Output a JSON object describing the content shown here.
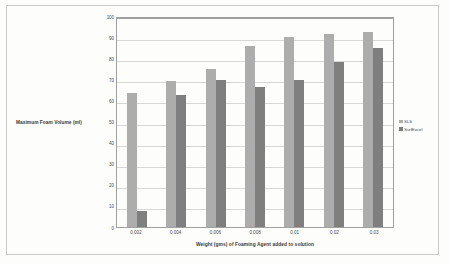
{
  "chart_data": {
    "type": "bar",
    "title": "",
    "xlabel": "Weight (gms) of Foaming Agent added to solution",
    "ylabel": "Maximum Foam Volume (ml)",
    "categories": [
      "0.002",
      "0.004",
      "0.006",
      "0.008",
      "0.01",
      "0.02",
      "0.03"
    ],
    "series": [
      {
        "name": "SLS",
        "color": "#adadad",
        "values": [
          63.5,
          69,
          75,
          86,
          90,
          91.5,
          92.5
        ]
      },
      {
        "name": "SurfExcel",
        "color": "#7f7f7f",
        "values": [
          7.5,
          62.5,
          69.5,
          66.5,
          69.5,
          78,
          85
        ]
      }
    ],
    "ylim": [
      0,
      100
    ],
    "ytick_step": 10,
    "yticks": [
      "100",
      "90",
      "80",
      "70",
      "60",
      "50",
      "40",
      "30",
      "20",
      "10",
      "0"
    ],
    "grid": true,
    "legend_position": "right"
  },
  "legend": {
    "items": [
      {
        "label": "SLS",
        "color": "#adadad"
      },
      {
        "label": "SurfExcel",
        "color": "#7f7f7f"
      }
    ]
  }
}
